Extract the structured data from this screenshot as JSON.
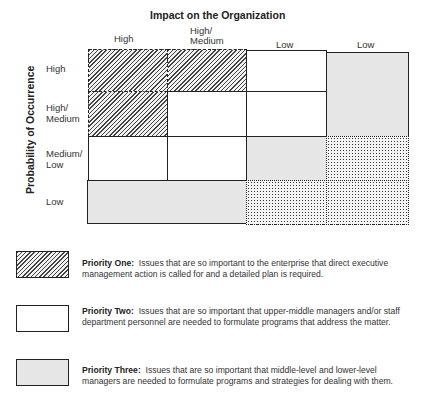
{
  "diagram": {
    "title": "Impact on the Organization",
    "y_axis_label": "Probability of Occurrence",
    "columns": [
      {
        "label": "High"
      },
      {
        "label": "High/\nMedium"
      },
      {
        "label": "Low"
      },
      {
        "label": "Low"
      }
    ],
    "rows": [
      {
        "label": "High"
      },
      {
        "label": "High/\nMedium"
      },
      {
        "label": "Medium/\nLow"
      },
      {
        "label": "Low"
      }
    ],
    "cells": [
      {
        "row": 0,
        "col": 0,
        "priority": "Priority One",
        "pattern": "diagonal-hatch"
      },
      {
        "row": 0,
        "col": 1,
        "priority": "Priority One",
        "pattern": "diagonal-hatch"
      },
      {
        "row": 0,
        "col": 2,
        "priority": "Priority Two",
        "pattern": "white"
      },
      {
        "rows": [
          0,
          1
        ],
        "col": 3,
        "priority": "Priority Three",
        "pattern": "light-gray"
      },
      {
        "row": 1,
        "col": 0,
        "priority": "Priority One",
        "pattern": "diagonal-hatch"
      },
      {
        "row": 1,
        "col": 1,
        "priority": "Priority Two",
        "pattern": "white"
      },
      {
        "row": 1,
        "col": 2,
        "priority": "Priority Two",
        "pattern": "white"
      },
      {
        "row": 2,
        "col": 0,
        "priority": "Priority Two",
        "pattern": "white"
      },
      {
        "row": 2,
        "col": 1,
        "priority": "Priority Two",
        "pattern": "white"
      },
      {
        "row": 2,
        "col": 2,
        "priority": "Priority Three",
        "pattern": "light-gray"
      },
      {
        "row": 2,
        "col": 3,
        "priority": "Unlabeled",
        "pattern": "crosshatch-dots"
      },
      {
        "row": 3,
        "cols": [
          0,
          1
        ],
        "priority": "Priority Three",
        "pattern": "light-gray"
      },
      {
        "row": 3,
        "col": 2,
        "priority": "Unlabeled",
        "pattern": "crosshatch-dots"
      },
      {
        "row": 3,
        "col": 3,
        "priority": "Unlabeled",
        "pattern": "crosshatch-dots"
      }
    ]
  },
  "legend": [
    {
      "pattern": "diagonal-hatch",
      "title": "Priority One:",
      "text": "Issues that are so important to the enterprise that direct executive management action is called for and a detailed plan is required."
    },
    {
      "pattern": "white",
      "title": "Priority Two:",
      "text": "Issues that are so important that upper-middle managers and/or staff department personnel are needed to formulate programs that address the matter."
    },
    {
      "pattern": "light-gray",
      "title": "Priority Three:",
      "text": "Issues that are so important that middle-level and lower-level managers are needed to formulate programs and strategies for dealing with them."
    }
  ]
}
